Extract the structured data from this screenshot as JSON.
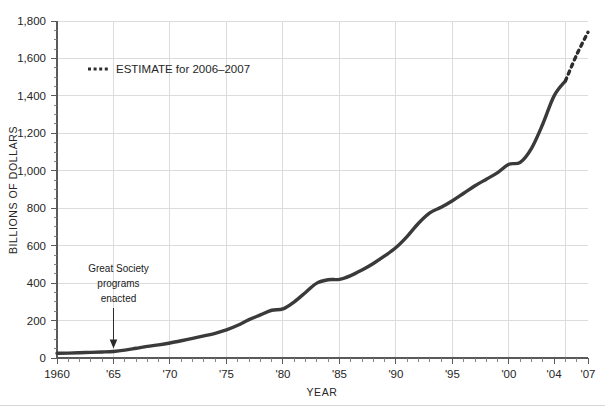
{
  "chart_data": {
    "type": "line",
    "title": "",
    "xlabel": "YEAR",
    "ylabel": "BILLIONS OF DOLLARS",
    "xlim": [
      1960,
      2007
    ],
    "ylim": [
      0,
      1800
    ],
    "grid": true,
    "legend_position": "upper-left-inside",
    "y_ticks": [
      0,
      200,
      400,
      600,
      800,
      1000,
      1200,
      1400,
      1600,
      1800
    ],
    "y_tick_labels": [
      "0",
      "200",
      "400",
      "600",
      "800",
      "1,000",
      "1,200",
      "1,400",
      "1,600",
      "1,800"
    ],
    "y_minor_step": 50,
    "x_ticks": [
      1960,
      1965,
      1970,
      1975,
      1980,
      1985,
      1990,
      1995,
      2000,
      2004,
      2007
    ],
    "x_tick_labels": [
      "1960",
      "'65",
      "'70",
      "'75",
      "'80",
      "'85",
      "'90",
      "'95",
      "'00",
      "'04",
      "'07"
    ],
    "x_gridline_years": [
      1965,
      1970,
      1975,
      1980,
      1985,
      1990,
      1995,
      2000,
      2005
    ],
    "x_minor_step": 1,
    "series": [
      {
        "name": "Actual",
        "style": "solid",
        "color": "#3a3a3a",
        "x": [
          1960,
          1961,
          1962,
          1963,
          1964,
          1965,
          1966,
          1967,
          1968,
          1969,
          1970,
          1971,
          1972,
          1973,
          1974,
          1975,
          1976,
          1977,
          1978,
          1979,
          1980,
          1981,
          1982,
          1983,
          1984,
          1985,
          1986,
          1987,
          1988,
          1989,
          1990,
          1991,
          1992,
          1993,
          1994,
          1995,
          1996,
          1997,
          1998,
          1999,
          2000,
          2001,
          2002,
          2003,
          2004,
          2005
        ],
        "y": [
          25,
          26,
          28,
          30,
          32,
          35,
          42,
          52,
          62,
          70,
          80,
          92,
          105,
          118,
          132,
          150,
          175,
          205,
          230,
          255,
          262,
          300,
          350,
          400,
          418,
          420,
          440,
          470,
          505,
          545,
          590,
          650,
          720,
          775,
          805,
          840,
          880,
          920,
          955,
          990,
          1035,
          1045,
          1120,
          1250,
          1400,
          1480
        ],
        "unit": "billions of dollars"
      },
      {
        "name": "Estimate",
        "style": "dotted",
        "color": "#2d2d2d",
        "x": [
          2005,
          2006,
          2007
        ],
        "y": [
          1480,
          1620,
          1740
        ],
        "unit": "billions of dollars"
      }
    ],
    "annotations": [
      {
        "name": "great-society-annotation",
        "lines": [
          "Great Society",
          "programs",
          "enacted"
        ],
        "target_x": 1965,
        "target_y": 35,
        "arrow": "down"
      }
    ],
    "legend": [
      {
        "label": "ESTIMATE for 2006–2007",
        "style": "dotted"
      }
    ]
  },
  "axes": {
    "y_title": "BILLIONS OF DOLLARS",
    "x_title": "YEAR"
  },
  "colors": {
    "line": "#3a3a3a",
    "estimate": "#2d2d2d",
    "grid": "#dcdcdc",
    "axis": "#5a5a5a",
    "text": "#262626",
    "background": "#ffffff"
  }
}
